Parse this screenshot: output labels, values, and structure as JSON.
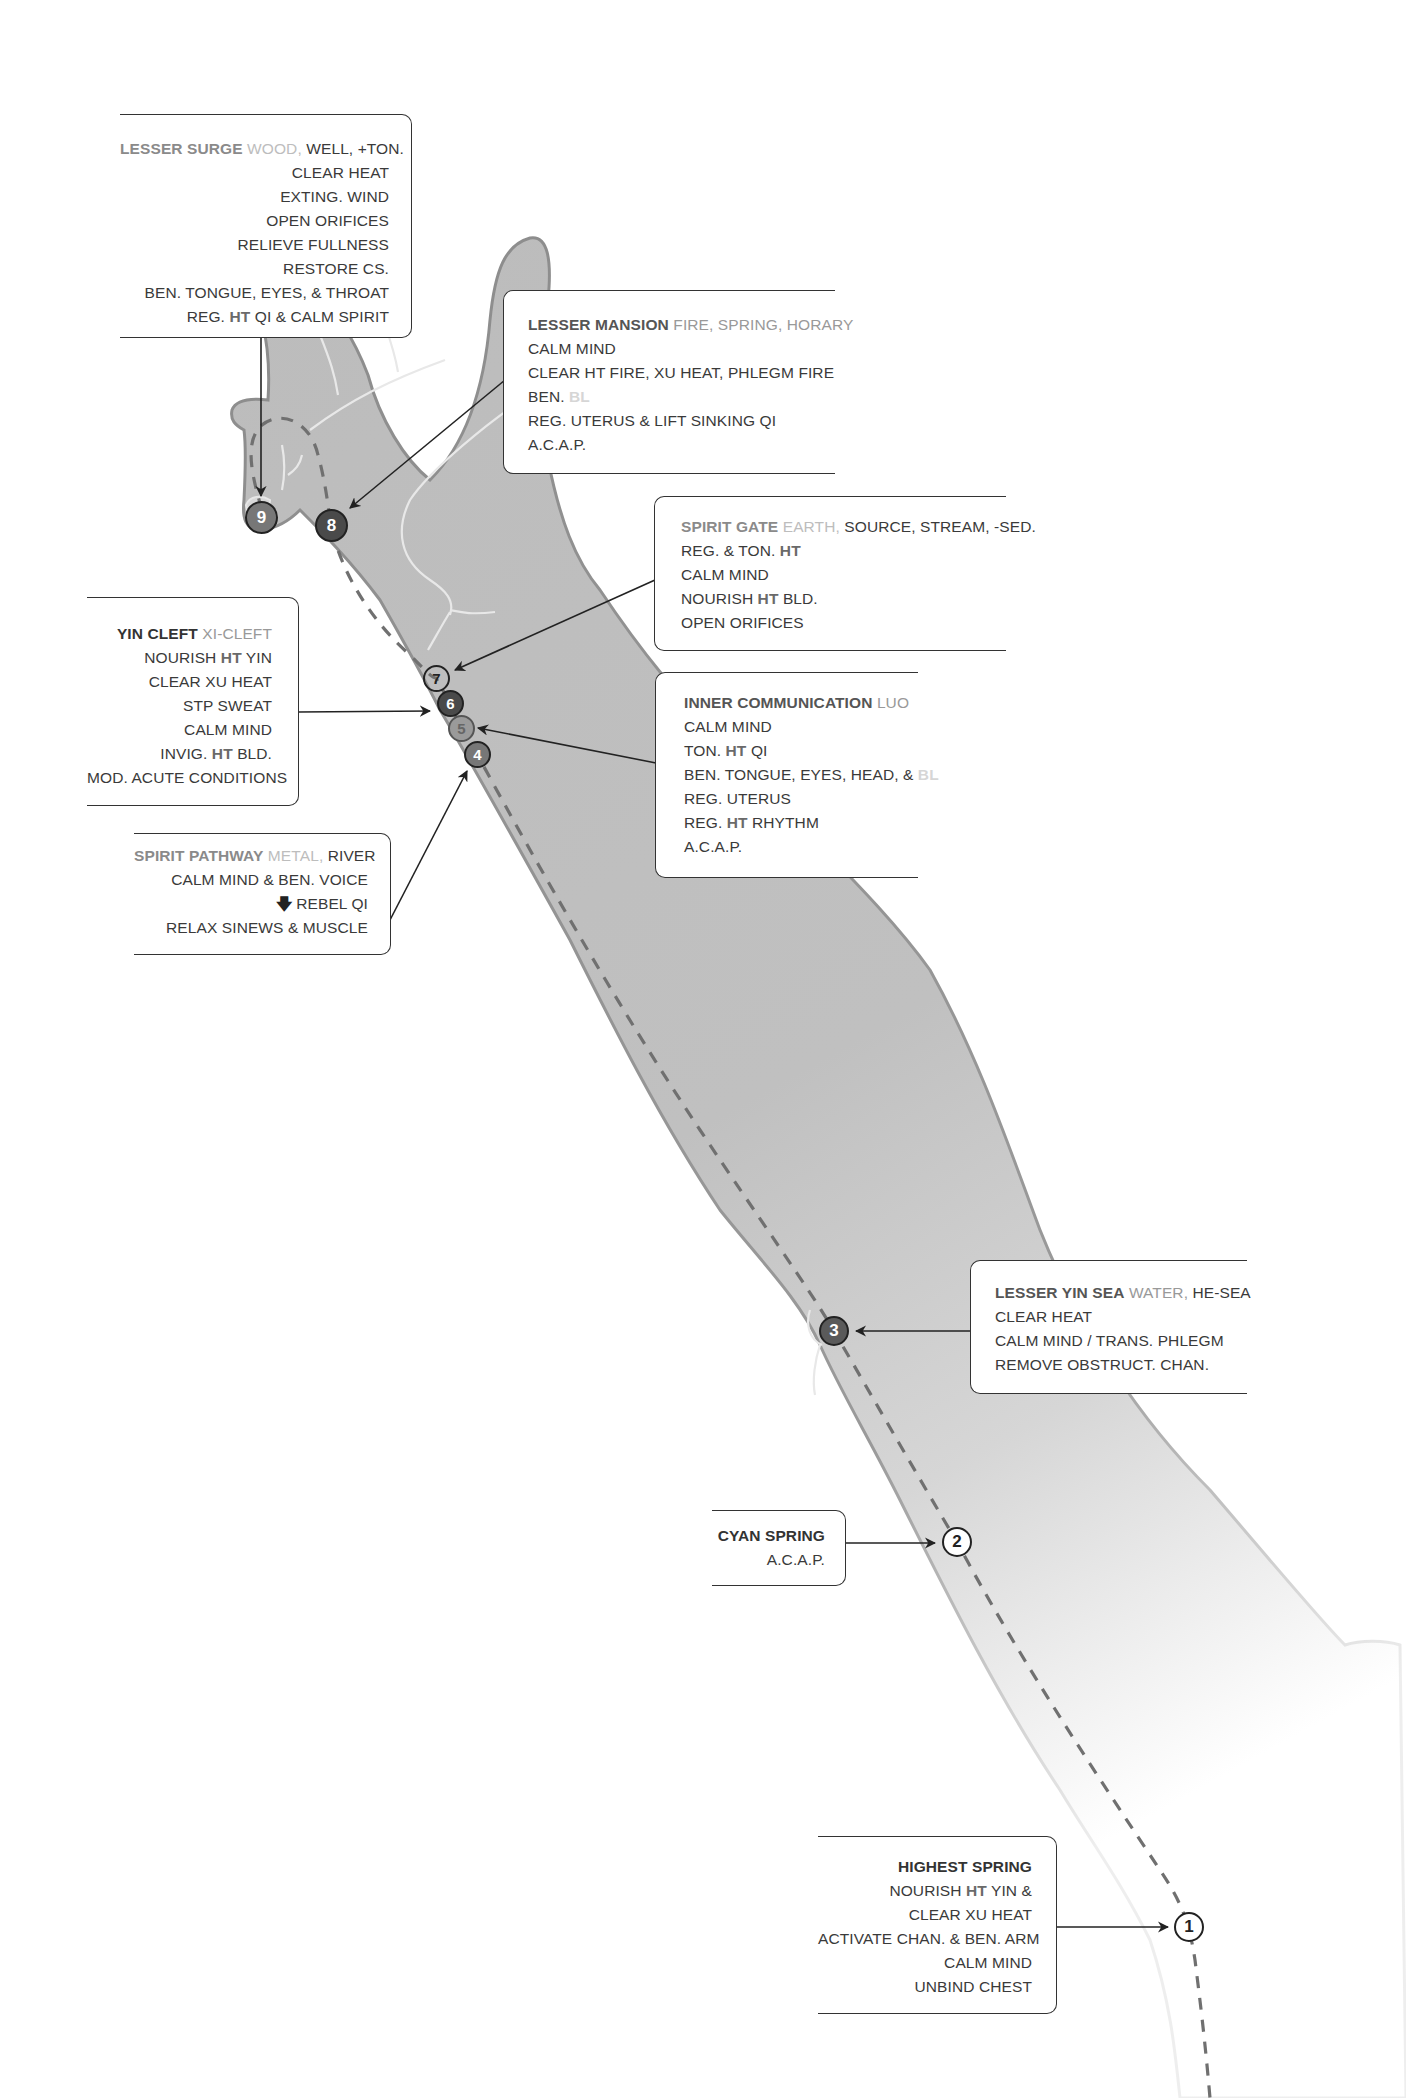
{
  "diagram": {
    "colors": {
      "arm_fill": "#bdbdbd",
      "arm_outline": "#8f8f8f",
      "channel_line": "#6e6e6e",
      "box_border": "#333333",
      "text": "#3a3a3a",
      "ht_highlight": "#6a6a6a",
      "bl_highlight": "#d6d6d6"
    }
  },
  "points": [
    {
      "number": "1",
      "style": "white"
    },
    {
      "number": "2",
      "style": "white"
    },
    {
      "number": "3",
      "style": "dark"
    },
    {
      "number": "4",
      "style": "mid"
    },
    {
      "number": "5",
      "style": "grey"
    },
    {
      "number": "6",
      "style": "darker"
    },
    {
      "number": "7",
      "style": "clear"
    },
    {
      "number": "8",
      "style": "darker"
    },
    {
      "number": "9",
      "style": "mid"
    }
  ],
  "callouts": {
    "lesser_surge": {
      "name": "LESSER SURGE",
      "tag_a": "WOOD,",
      "tag_b": "WELL, +TON.",
      "lines": [
        "CLEAR HEAT",
        "EXTING. WIND",
        "OPEN ORIFICES",
        "RELIEVE FULLNESS",
        "RESTORE CS.",
        "BEN. TONGUE, EYES, & THROAT"
      ],
      "last_pre": "REG.",
      "last_ht": "HT",
      "last_post": "QI & CALM SPIRIT"
    },
    "lesser_mansion": {
      "name": "LESSER MANSION",
      "tag": "FIRE, SPRING, HORARY",
      "line1": "CALM MIND",
      "line2": "CLEAR HT FIRE, XU HEAT, PHLEGM FIRE",
      "line3_pre": "BEN.",
      "line3_bl": "BL",
      "line4": "REG. UTERUS & LIFT SINKING QI",
      "line5": "A.C.A.P."
    },
    "spirit_gate": {
      "name": "SPIRIT GATE",
      "tag_a": "EARTH,",
      "tag_b": "SOURCE, STREAM, -SED.",
      "line1_pre": "REG. & TON.",
      "line1_ht": "HT",
      "line2": "CALM MIND",
      "line3_pre": "NOURISH",
      "line3_ht": "HT",
      "line3_post": "BLD.",
      "line4": "OPEN ORIFICES"
    },
    "yin_cleft": {
      "name": "YIN CLEFT",
      "tag": "XI-CLEFT",
      "line1_pre": "NOURISH",
      "line1_ht": "HT",
      "line1_post": "YIN",
      "line2": "CLEAR XU HEAT",
      "line3": "STP SWEAT",
      "line4": "CALM MIND",
      "line5_pre": "INVIG.",
      "line5_ht": "HT",
      "line5_post": "BLD.",
      "line6": "MOD. ACUTE CONDITIONS"
    },
    "inner_communication": {
      "name": "INNER COMMUNICATION",
      "tag": "LUO",
      "line1": "CALM MIND",
      "line2_pre": "TON.",
      "line2_ht": "HT",
      "line2_post": "QI",
      "line3_pre": "BEN. TONGUE, EYES, HEAD, &",
      "line3_bl": "BL",
      "line4": "REG. UTERUS",
      "line5_pre": "REG.",
      "line5_ht": "HT",
      "line5_post": "RHYTHM",
      "line6": "A.C.A.P."
    },
    "spirit_pathway": {
      "name": "SPIRIT PATHWAY",
      "tag_a": "METAL,",
      "tag_b": "RIVER",
      "line1": "CALM MIND & BEN. VOICE",
      "line2_icon": "down-arrow",
      "line2": "REBEL QI",
      "line3": "RELAX SINEWS & MUSCLE"
    },
    "lesser_yin_sea": {
      "name": "LESSER YIN SEA",
      "tag_a": "WATER,",
      "tag_b": "HE-SEA",
      "line1": "CLEAR HEAT",
      "line2": "CALM MIND / TRANS. PHLEGM",
      "line3": "REMOVE OBSTRUCT. CHAN."
    },
    "cyan_spring": {
      "name": "CYAN SPRING",
      "line1": "A.C.A.P."
    },
    "highest_spring": {
      "name": "HIGHEST SPRING",
      "line1_pre": "NOURISH",
      "line1_ht": "HT",
      "line1_post": "YIN &",
      "line2": "CLEAR XU HEAT",
      "line3": "ACTIVATE CHAN. & BEN. ARM",
      "line4": "CALM MIND",
      "line5": "UNBIND CHEST"
    }
  }
}
